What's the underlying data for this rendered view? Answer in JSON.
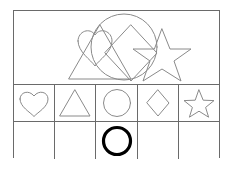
{
  "worksheet": {
    "title": "Shape counting worksheet",
    "outline_color": "#6a6a6a",
    "shape_stroke_color": "#8a8a8a",
    "answer_mark_color": "#000000",
    "background_color": "#ffffff"
  },
  "top_panel": {
    "label": "Overlapping shapes picture",
    "shapes": [
      {
        "name": "heart",
        "count": 1
      },
      {
        "name": "triangle",
        "count": 1
      },
      {
        "name": "circle",
        "count": 1
      },
      {
        "name": "diamond",
        "count": 1
      },
      {
        "name": "star",
        "count": 1
      }
    ]
  },
  "shape_row": {
    "label": "Shape key row",
    "cells": [
      {
        "shape": "heart",
        "label": "Heart"
      },
      {
        "shape": "triangle",
        "label": "Triangle"
      },
      {
        "shape": "circle",
        "label": "Circle"
      },
      {
        "shape": "diamond",
        "label": "Diamond"
      },
      {
        "shape": "star",
        "label": "Star"
      }
    ]
  },
  "answer_row": {
    "label": "Answer row",
    "cells": [
      {
        "shape": "heart",
        "marked": false,
        "mark": ""
      },
      {
        "shape": "triangle",
        "marked": false,
        "mark": ""
      },
      {
        "shape": "circle",
        "marked": true,
        "mark": "circle-outline"
      },
      {
        "shape": "diamond",
        "marked": false,
        "mark": ""
      },
      {
        "shape": "star",
        "marked": false,
        "mark": ""
      }
    ]
  }
}
